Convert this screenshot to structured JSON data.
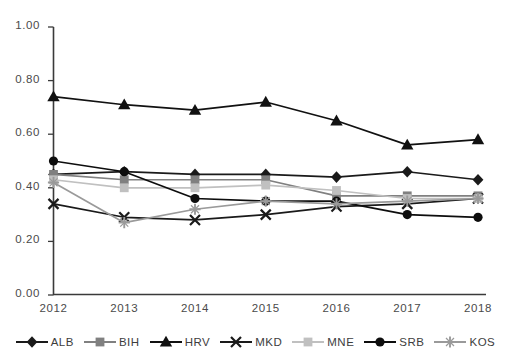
{
  "chart_data": {
    "type": "line",
    "title": "",
    "xlabel": "",
    "ylabel": "",
    "categories": [
      "2012",
      "2013",
      "2014",
      "2015",
      "2016",
      "2017",
      "2018"
    ],
    "x": [
      2012,
      2013,
      2014,
      2015,
      2016,
      2017,
      2018
    ],
    "ylim": [
      0.0,
      1.0
    ],
    "yticks": [
      0.0,
      0.2,
      0.4,
      0.6,
      0.8,
      1.0
    ],
    "ytick_labels": [
      "0.00",
      "0.20",
      "0.40",
      "0.60",
      "0.80",
      "1.00"
    ],
    "grid": false,
    "legend_position": "bottom",
    "series": [
      {
        "name": "ALB",
        "marker": "diamond",
        "color": "#1a1a1a",
        "values": [
          0.45,
          0.46,
          0.45,
          0.45,
          0.44,
          0.46,
          0.43
        ]
      },
      {
        "name": "BIH",
        "marker": "square",
        "color": "#808080",
        "values": [
          0.45,
          0.43,
          0.43,
          0.43,
          0.37,
          0.37,
          0.37
        ]
      },
      {
        "name": "HRV",
        "marker": "triangle",
        "color": "#111111",
        "values": [
          0.74,
          0.71,
          0.69,
          0.72,
          0.65,
          0.56,
          0.58
        ]
      },
      {
        "name": "MKD",
        "marker": "x",
        "color": "#1a1a1a",
        "values": [
          0.34,
          0.29,
          0.28,
          0.3,
          0.33,
          0.34,
          0.36
        ]
      },
      {
        "name": "MNE",
        "marker": "square",
        "color": "#c0c0c0",
        "values": [
          0.43,
          0.4,
          0.4,
          0.41,
          0.39,
          0.36,
          0.36
        ]
      },
      {
        "name": "SRB",
        "marker": "circle",
        "color": "#0d0d0d",
        "values": [
          0.5,
          0.46,
          0.36,
          0.35,
          0.35,
          0.3,
          0.29
        ]
      },
      {
        "name": "KOS",
        "marker": "plus",
        "color": "#9a9a9a",
        "values": [
          0.42,
          0.27,
          0.32,
          0.35,
          0.34,
          0.35,
          0.36
        ]
      }
    ]
  },
  "axis": {
    "x_labels": [
      "2012",
      "2013",
      "2014",
      "2015",
      "2016",
      "2017",
      "2018"
    ],
    "y_labels": [
      "1.00",
      "0.80",
      "0.60",
      "0.40",
      "0.20",
      "0.00"
    ]
  },
  "legend": {
    "items": [
      {
        "label": "ALB",
        "marker": "diamond",
        "color": "#1a1a1a"
      },
      {
        "label": "BIH",
        "marker": "square",
        "color": "#808080"
      },
      {
        "label": "HRV",
        "marker": "triangle",
        "color": "#111111"
      },
      {
        "label": "MKD",
        "marker": "x",
        "color": "#1a1a1a"
      },
      {
        "label": "MNE",
        "marker": "square",
        "color": "#c0c0c0"
      },
      {
        "label": "SRB",
        "marker": "circle",
        "color": "#0d0d0d"
      },
      {
        "label": "KOS",
        "marker": "plus",
        "color": "#9a9a9a"
      }
    ]
  }
}
